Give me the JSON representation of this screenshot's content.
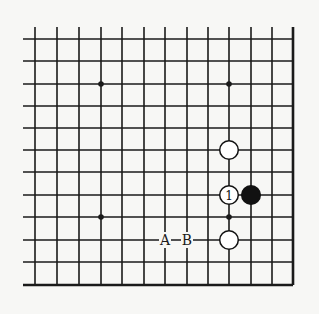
{
  "board": {
    "cols_x": [
      35,
      57,
      79,
      101,
      122,
      144,
      165,
      187,
      208,
      229,
      251,
      272,
      293
    ],
    "rows_y": [
      39,
      61,
      84,
      106,
      128,
      150,
      172,
      195,
      217,
      240,
      262,
      285
    ],
    "open_left_x": 23,
    "open_top_y": 27,
    "line_color": "#1a1a1a",
    "background": "#f7f7f5"
  },
  "star_points": [
    {
      "x": 101,
      "y": 84
    },
    {
      "x": 229,
      "y": 84
    },
    {
      "x": 101,
      "y": 217
    },
    {
      "x": 229,
      "y": 217
    }
  ],
  "stones": [
    {
      "color": "white",
      "x": 229,
      "y": 150,
      "label": ""
    },
    {
      "color": "white",
      "x": 229,
      "y": 195,
      "label": "1"
    },
    {
      "color": "black",
      "x": 251,
      "y": 195,
      "label": ""
    },
    {
      "color": "white",
      "x": 229,
      "y": 240,
      "label": ""
    }
  ],
  "labels": [
    {
      "text": "A",
      "x": 165,
      "y": 240
    },
    {
      "text": "B",
      "x": 187,
      "y": 240
    }
  ]
}
